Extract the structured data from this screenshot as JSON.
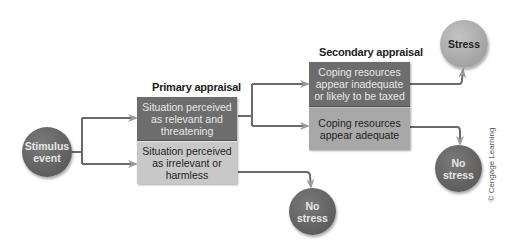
{
  "diagram": {
    "stages": {
      "primary_label": "Primary appraisal",
      "secondary_label": "Secondary appraisal"
    },
    "nodes": {
      "stimulus": "Stimulus event",
      "stimulus_line1": "Stimulus",
      "stimulus_line2": "event",
      "relevant": "Situation perceived as relevant and threatening",
      "irrelevant": "Situation perceived as irrelevant or harmless",
      "inadequate": "Coping resources appear inadequate or likely to be taxed",
      "adequate": "Coping resources appear adequate",
      "stress": "Stress",
      "no_stress_1_line1": "No",
      "no_stress_1_line2": "stress",
      "no_stress_2_line1": "No",
      "no_stress_2_line2": "stress"
    },
    "edges": [
      {
        "from": "Stimulus event",
        "to": "Situation perceived as relevant and threatening"
      },
      {
        "from": "Stimulus event",
        "to": "Situation perceived as irrelevant or harmless"
      },
      {
        "from": "Situation perceived as relevant and threatening",
        "to": "Coping resources appear inadequate or likely to be taxed"
      },
      {
        "from": "Situation perceived as relevant and threatening",
        "to": "Coping resources appear adequate"
      },
      {
        "from": "Coping resources appear inadequate or likely to be taxed",
        "to": "Stress"
      },
      {
        "from": "Coping resources appear adequate",
        "to": "No stress"
      },
      {
        "from": "Situation perceived as irrelevant or harmless",
        "to": "No stress"
      }
    ],
    "credit": "© Cengage Learning",
    "colors": {
      "dark_fill": "#6d6d6d",
      "light_fill": "#c8c8c8",
      "mid_fill": "#a8a8a8",
      "stress_fill": "#b0b0b0",
      "line": "#6a6a6a",
      "arrowhead": "#9a9a9a"
    }
  }
}
